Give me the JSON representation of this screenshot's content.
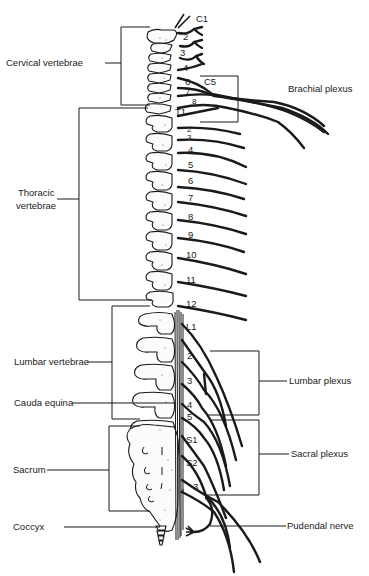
{
  "figure": {
    "colors": {
      "ink": "#1a1a1a",
      "background": "#ffffff"
    }
  },
  "left_labels": {
    "cervical": "Cervical vertebrae",
    "thoracic_1": "Thoracic",
    "thoracic_2": "vertebrae",
    "lumbar": "Lumbar vertebrae",
    "cauda": "Cauda equina",
    "sacrum": "Sacrum",
    "coccyx": "Coccyx"
  },
  "right_labels": {
    "brachial": "Brachial plexus",
    "lumbar_plexus": "Lumbar plexus",
    "sacral_plexus": "Sacral plexus",
    "pudendal": "Pudendal nerve"
  },
  "nerve_numbers": {
    "cervical": [
      "C1",
      "2",
      "3",
      "4",
      "C5",
      "6",
      "7",
      "8"
    ],
    "thoracic": [
      "T1",
      "2",
      "3",
      "4",
      "5",
      "6",
      "7",
      "8",
      "9",
      "10",
      "11",
      "12"
    ],
    "lumbar": [
      "L1",
      "2",
      "3",
      "4",
      "5"
    ],
    "sacral": [
      "S1",
      "S2",
      "3",
      "4"
    ]
  }
}
